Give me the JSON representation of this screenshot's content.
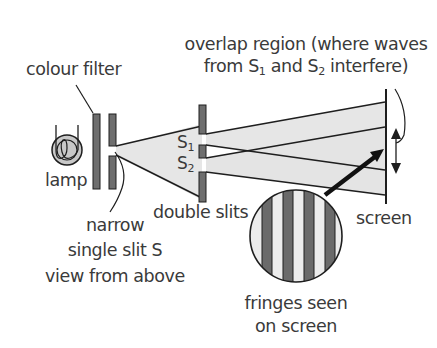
{
  "diagram": {
    "labels": {
      "colour_filter": "colour filter",
      "overlap_line1": "overlap region (where waves",
      "overlap_line2_a": "from S",
      "overlap_sub1": "1",
      "overlap_line2_b": " and S",
      "overlap_sub2": "2",
      "overlap_line2_c": " interfere)",
      "lamp": "lamp",
      "narrow": "narrow",
      "single_slit": "single slit S",
      "view_from_above": "view from above",
      "double_slits": "double slits",
      "screen": "screen",
      "fringes_line1": "fringes seen",
      "fringes_line2": "on screen",
      "s1_letter": "S",
      "s1_sub": "1",
      "s2_letter": "S",
      "s2_sub": "2"
    },
    "colors": {
      "slit_fill": "#6e6e6e",
      "beam_fill": "#e6e6e6",
      "line": "#1e1e1e",
      "dark_fringe": "#6a6a6a",
      "light_fringe": "#ececec"
    },
    "icons": [
      "lamp-icon",
      "arrow-icon",
      "double-headed-arrow-icon"
    ]
  }
}
